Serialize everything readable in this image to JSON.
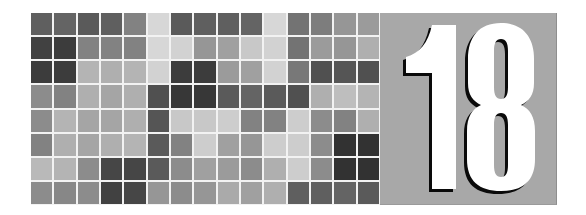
{
  "chapter": {
    "number": "18",
    "panel_color": "#a8a8a8",
    "digit_color": "#ffffff",
    "shadow_color": "#0a0a0a"
  },
  "mosaic": {
    "columns": 15,
    "rows": 8,
    "gap_color": "#f2f2f2",
    "gray_levels": [
      [
        95,
        100,
        90,
        95,
        130,
        215,
        90,
        95,
        95,
        100,
        215,
        115,
        125,
        150,
        155
      ],
      [
        65,
        60,
        130,
        130,
        130,
        215,
        210,
        150,
        160,
        200,
        210,
        115,
        155,
        150,
        175
      ],
      [
        60,
        60,
        180,
        175,
        180,
        210,
        60,
        60,
        155,
        160,
        210,
        120,
        80,
        85,
        80
      ],
      [
        140,
        130,
        175,
        165,
        175,
        80,
        55,
        55,
        90,
        100,
        90,
        80,
        175,
        190,
        180
      ],
      [
        140,
        180,
        165,
        165,
        175,
        85,
        200,
        200,
        205,
        130,
        130,
        205,
        140,
        130,
        175
      ],
      [
        130,
        175,
        165,
        175,
        180,
        90,
        130,
        205,
        160,
        150,
        205,
        205,
        140,
        50,
        50
      ],
      [
        185,
        180,
        140,
        70,
        70,
        90,
        140,
        160,
        155,
        140,
        175,
        205,
        140,
        50,
        50
      ],
      [
        140,
        135,
        140,
        65,
        70,
        150,
        140,
        150,
        170,
        160,
        175,
        95,
        95,
        100,
        90
      ]
    ]
  }
}
